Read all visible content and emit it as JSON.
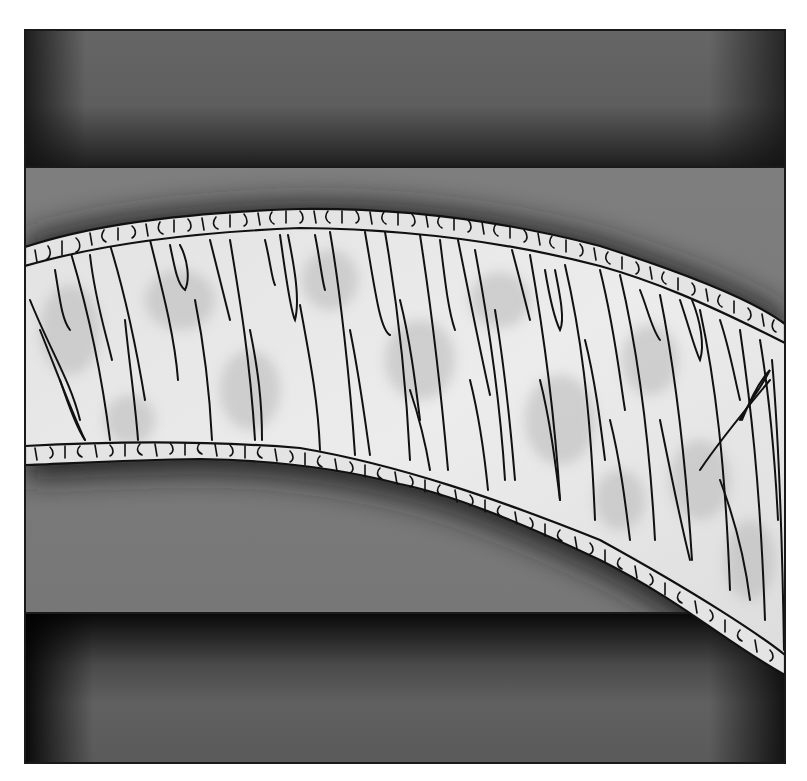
{
  "illustration": {
    "subject": "pleated fabric ruffle band across gray panels",
    "colors": {
      "page_background": "#ffffff",
      "frame_stroke": "#1a1a1a",
      "top_panel": "#606060",
      "middle_panel": "#7a7a7a",
      "bottom_panel": "#5e5e5e",
      "panel_shadow": "#1c1c1c",
      "fabric_light": "#e6e6e6",
      "fabric_mottle": "#bdbdbd",
      "ink": "#111111"
    },
    "frame": {
      "x": 25,
      "y": 30,
      "width": 760,
      "height": 733
    },
    "dividers": [
      167,
      613
    ],
    "band": {
      "top_stitch": [
        [
          25,
          266
        ],
        [
          100,
          244
        ],
        [
          200,
          232
        ],
        [
          300,
          228
        ],
        [
          400,
          229
        ],
        [
          500,
          240
        ],
        [
          600,
          266
        ],
        [
          700,
          300
        ],
        [
          785,
          343
        ]
      ],
      "bottom_stitch": [
        [
          25,
          446
        ],
        [
          100,
          442
        ],
        [
          200,
          440
        ],
        [
          300,
          448
        ],
        [
          400,
          465
        ],
        [
          500,
          500
        ],
        [
          600,
          540
        ],
        [
          700,
          595
        ],
        [
          785,
          655
        ]
      ],
      "ruffle_depth": 19
    }
  }
}
